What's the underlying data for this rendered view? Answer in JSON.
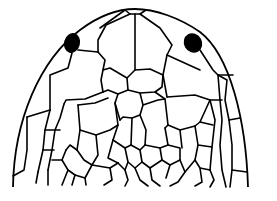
{
  "figure": {
    "colors": {
      "line": "#000000",
      "background": "#ffffff",
      "eye_spot": "#000000"
    },
    "elements": [
      "head-outline",
      "left-eye-spot",
      "right-eye-spot",
      "head-scales"
    ]
  }
}
